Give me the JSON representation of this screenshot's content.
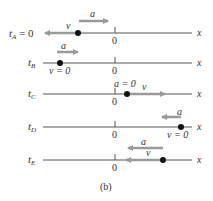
{
  "figure": {
    "caption": "(b)",
    "axis_label": "x",
    "origin_label": "0",
    "colors": {
      "axis": "#555555",
      "arrow": "#9a9a9a",
      "dot": "#111111",
      "text": "#333333"
    }
  },
  "rows": [
    {
      "id": "A",
      "time_label": "t",
      "time_sub": "A",
      "time_suffix": " = 0",
      "a_label": "a",
      "a_direction": "right",
      "v_label": "v",
      "v_direction": "left",
      "particle_position": "left of origin"
    },
    {
      "id": "B",
      "time_label": "t",
      "time_sub": "B",
      "time_suffix": "",
      "a_label": "a",
      "a_direction": "right",
      "v_label": "v = 0",
      "v_direction": "none",
      "particle_position": "far left of origin"
    },
    {
      "id": "C",
      "time_label": "t",
      "time_sub": "C",
      "time_suffix": "",
      "a_label": "a = 0",
      "a_direction": "none",
      "v_label": "v",
      "v_direction": "right",
      "particle_position": "just right of origin"
    },
    {
      "id": "D",
      "time_label": "t",
      "time_sub": "D",
      "time_suffix": "",
      "a_label": "a",
      "a_direction": "left",
      "v_label": "v = 0",
      "v_direction": "none",
      "particle_position": "far right of origin"
    },
    {
      "id": "E",
      "time_label": "t",
      "time_sub": "E",
      "time_suffix": "",
      "a_label": "a",
      "a_direction": "left",
      "v_label": "v",
      "v_direction": "left",
      "particle_position": "right of origin"
    }
  ]
}
